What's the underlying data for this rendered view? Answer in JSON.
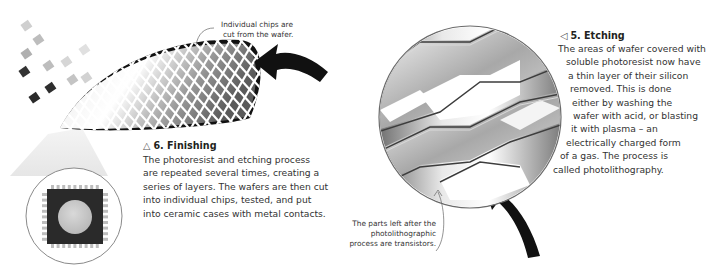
{
  "step5": {
    "marker": "◁",
    "title": "5. Etching",
    "lines": [
      "The areas of wafer covered with",
      "soluble photoresist now have",
      "a thin layer of their silicon",
      "removed. This is done",
      "either by washing the",
      "wafer with acid, or blasting",
      "it with plasma – an",
      "electrically charged form",
      "of a gas. The process is",
      "called photolithography."
    ]
  },
  "step6": {
    "marker": "△",
    "title": "6. Finishing",
    "lines": [
      "The photoresist and etching process",
      "are repeated several times, creating a",
      "series of layers. The wafers are then cut",
      "into individual chips, tested, and put",
      "into ceramic cases with metal contacts."
    ]
  },
  "annotations": {
    "chips": [
      "Individual chips are",
      "cut from the wafer."
    ],
    "transistors": [
      "The parts left after the",
      "photolithographic",
      "process are transistors."
    ]
  },
  "colors": {
    "arrow": "#111111",
    "text": "#231f20",
    "circle_outline": "#8a8a8a"
  }
}
